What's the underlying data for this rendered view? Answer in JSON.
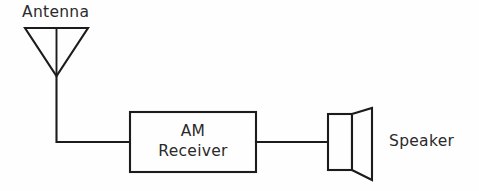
{
  "diagram": {
    "background_color": "#fefefe",
    "line_color": "#1c1c1c",
    "text_color": "#2a2a2a",
    "antenna": {
      "label": "Antenna",
      "symbol": "dipole-triangle-antenna"
    },
    "receiver_block": {
      "line1": "AM",
      "line2": "Receiver",
      "symbol": "rectangular-block"
    },
    "speaker": {
      "label": "Speaker",
      "symbol": "loudspeaker-cone"
    },
    "connections": [
      {
        "from": "antenna",
        "to": "receiver_block"
      },
      {
        "from": "receiver_block",
        "to": "speaker"
      }
    ]
  }
}
